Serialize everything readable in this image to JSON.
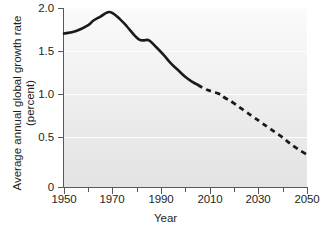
{
  "chart_data": {
    "type": "line",
    "title": "",
    "xlabel": "Year",
    "ylabel": "Average annual global growth rate\n(percent)",
    "ylabel_line1": "Average annual global growth rate",
    "ylabel_line2": "(percent)",
    "xlim": [
      1950,
      2050
    ],
    "ylim": [
      0,
      2.1
    ],
    "grid": true,
    "grid_axis": "y",
    "legend": "none",
    "x_ticks_major": [
      1950,
      1970,
      1990,
      2010,
      2030,
      2050
    ],
    "x_tick_labels": [
      "1950",
      "1970",
      "1990",
      "2010",
      "2030",
      "2050"
    ],
    "x_ticks_minor": [
      1960,
      1980,
      2000,
      2020,
      2040
    ],
    "y_ticks": [
      0,
      0.5,
      1.0,
      1.5,
      2.0
    ],
    "y_tick_labels": [
      "0",
      "0.5",
      "1.0",
      "1.5",
      "2.0"
    ],
    "series": [
      {
        "name": "Historical (observed)",
        "style": "solid",
        "color": "#1a1a1a",
        "x": [
          1950,
          1955,
          1960,
          1962,
          1965,
          1968,
          1970,
          1973,
          1976,
          1979,
          1981,
          1983,
          1985,
          1988,
          1991,
          1994,
          1997,
          2000,
          2003,
          2005
        ],
        "values": [
          1.8,
          1.83,
          1.9,
          1.95,
          2.0,
          2.05,
          2.04,
          1.97,
          1.88,
          1.78,
          1.73,
          1.72,
          1.72,
          1.64,
          1.55,
          1.45,
          1.37,
          1.29,
          1.23,
          1.2
        ]
      },
      {
        "name": "Projected",
        "style": "dashed",
        "color": "#1a1a1a",
        "x": [
          2005,
          2008,
          2011,
          2014,
          2016,
          2019,
          2022,
          2025,
          2028,
          2031,
          2034,
          2037,
          2040,
          2043,
          2046,
          2050
        ],
        "values": [
          1.2,
          1.15,
          1.12,
          1.09,
          1.05,
          1.0,
          0.94,
          0.88,
          0.82,
          0.76,
          0.7,
          0.64,
          0.58,
          0.51,
          0.45,
          0.38
        ]
      }
    ]
  },
  "colors": {
    "line": "#1a1a1a",
    "axis": "#58585a",
    "gridline": "#fdfdfd",
    "plot_background_top": "#fbfbfb",
    "plot_background_bottom": "#e3e3e3",
    "text": "#231f20",
    "page_background": "#ffffff"
  }
}
